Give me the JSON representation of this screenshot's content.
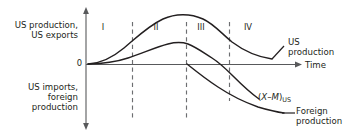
{
  "figure": {
    "colors": {
      "curve": "#231f20",
      "axis": "#58595b",
      "dashed": "#6d6e71",
      "text": "#231f20"
    }
  },
  "axes": {
    "y_upper_label": "US production,\nUS exports",
    "y_lower_label": "US imports,\nforeign\nproduction",
    "origin_label": "0",
    "x_label": "Time"
  },
  "stages": [
    {
      "label": "I",
      "x": 103
    },
    {
      "label": "II",
      "x": 156
    },
    {
      "label": "III",
      "x": 201
    },
    {
      "label": "IV",
      "x": 248
    }
  ],
  "dividers": [
    {
      "x": 132,
      "y1": 22,
      "y2": 119
    },
    {
      "x": 186,
      "y1": 22,
      "y2": 119
    },
    {
      "x": 229,
      "y1": 22,
      "y2": 101
    }
  ],
  "curve_labels": [
    {
      "name": "us-production-label",
      "text": "US\nproduction",
      "x": 288,
      "y": 37
    },
    {
      "name": "net-exports-label",
      "text": "(X–M)US",
      "x": 258,
      "y": 96
    },
    {
      "name": "foreign-production-label",
      "text": "Foreign\nproduction",
      "x": 287,
      "y": 108
    }
  ],
  "chart_data": {
    "type": "line",
    "xlabel": "Time",
    "ylabel_positive": "US production, US exports",
    "ylabel_negative": "US imports, foreign production",
    "grid": false,
    "legend": "inline-right",
    "stage_boundaries": [
      "I|II",
      "II|III",
      "III|IV"
    ],
    "series": [
      {
        "name": "US production",
        "points": [
          [
            0,
            0
          ],
          [
            10,
            3
          ],
          [
            20,
            10
          ],
          [
            30,
            24
          ],
          [
            40,
            42
          ],
          [
            50,
            62
          ],
          [
            60,
            79
          ],
          [
            70,
            90
          ],
          [
            75,
            94
          ],
          [
            80,
            95
          ],
          [
            85,
            93
          ],
          [
            92,
            87
          ],
          [
            100,
            75
          ],
          [
            110,
            57
          ],
          [
            120,
            39
          ],
          [
            130,
            26
          ],
          [
            140,
            20
          ],
          [
            150,
            18
          ]
        ]
      },
      {
        "name": "(X–M)US",
        "points": [
          [
            0,
            0
          ],
          [
            12,
            1
          ],
          [
            22,
            4
          ],
          [
            32,
            11
          ],
          [
            42,
            22
          ],
          [
            52,
            34
          ],
          [
            62,
            44
          ],
          [
            70,
            49
          ],
          [
            75,
            50
          ],
          [
            80,
            49
          ],
          [
            85,
            44
          ],
          [
            90,
            35
          ],
          [
            95,
            22
          ],
          [
            100,
            7
          ],
          [
            103,
            0
          ],
          [
            110,
            -18
          ],
          [
            120,
            -43
          ],
          [
            130,
            -68
          ],
          [
            138,
            -86
          ]
        ]
      },
      {
        "name": "Foreign production",
        "points": [
          [
            75,
            0
          ],
          [
            82,
            -10
          ],
          [
            90,
            -22
          ],
          [
            100,
            -38
          ],
          [
            110,
            -52
          ],
          [
            120,
            -63
          ],
          [
            132,
            -72
          ],
          [
            145,
            -77
          ],
          [
            155,
            -79
          ]
        ]
      }
    ]
  }
}
